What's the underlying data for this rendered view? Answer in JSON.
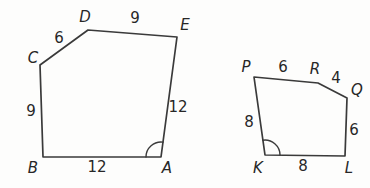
{
  "figure": {
    "left_polygon": {
      "vertices": {
        "A": "A",
        "B": "B",
        "C": "C",
        "D": "D",
        "E": "E"
      },
      "sides": {
        "CD": "6",
        "DE": "9",
        "EA": "12",
        "AB": "12",
        "BC": "9"
      },
      "angle_mark_at": "A"
    },
    "right_polygon": {
      "vertices": {
        "P": "P",
        "R": "R",
        "Q": "Q",
        "K": "K",
        "L": "L"
      },
      "sides": {
        "PR": "6",
        "RQ": "4",
        "QL": "6",
        "KL": "8",
        "PK": "8"
      },
      "angle_mark_at": "K"
    },
    "colors": {
      "stroke": "#3a3a3a",
      "text": "#272727",
      "background": "#fdfdfc"
    }
  }
}
